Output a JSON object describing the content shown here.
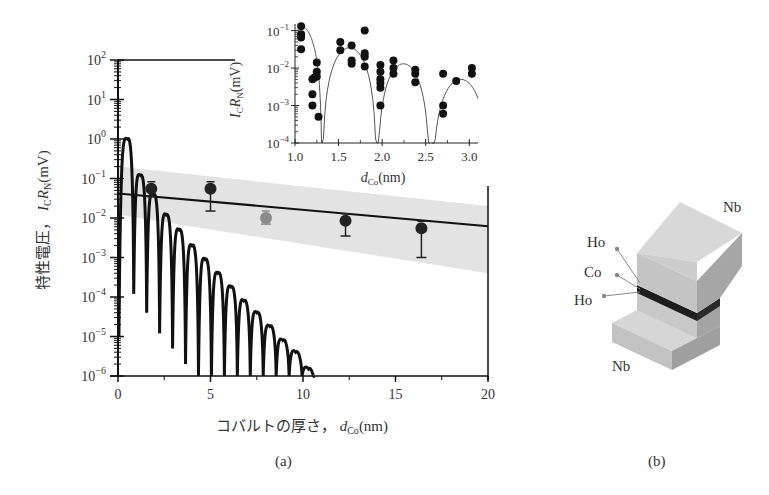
{
  "figure": {
    "panel_a_caption": "(a)",
    "panel_b_caption": "(b)"
  },
  "chart_data": [
    {
      "id": "main",
      "type": "line",
      "title": "",
      "xlabel": "コバルトの厚さ,  d_Co(nm)",
      "xlabel_parts": {
        "text": "コバルトの厚さ，",
        "var": "d",
        "sub": "Co",
        "unit": "(nm)"
      },
      "ylabel": "特性電圧,  I_C R_N(mV)",
      "ylabel_parts": {
        "text": "特性電圧，",
        "var1": "I",
        "sub1": "C",
        "var2": "R",
        "sub2": "N",
        "unit": "(mV)"
      },
      "yscale": "log",
      "xlim": [
        0,
        20
      ],
      "ylim": [
        1e-06,
        100
      ],
      "xticks": [
        0,
        5,
        10,
        15,
        20
      ],
      "xtick_labels": [
        "0",
        "5",
        "10",
        "15",
        "20"
      ],
      "yticks_exp": [
        2,
        1,
        0,
        -1,
        -2,
        -3,
        -4,
        -5,
        -6
      ],
      "series": [
        {
          "name": "experiment (black)",
          "kind": "scatter-errorbar",
          "color": "#222222",
          "x": [
            1.8,
            5.0,
            12.3,
            16.4
          ],
          "y": [
            0.055,
            0.055,
            0.0085,
            0.0055
          ],
          "yerr_low": [
            0.02,
            0.04,
            0.005,
            0.0045
          ]
        },
        {
          "name": "experiment (grey)",
          "kind": "scatter-errorbar",
          "color": "#8a8a8a",
          "x": [
            8.0
          ],
          "y": [
            0.01
          ],
          "yerr_low": [
            0.003
          ]
        },
        {
          "name": "exponential fit",
          "kind": "line",
          "x": [
            0,
            20
          ],
          "y": [
            0.042,
            0.0062
          ]
        },
        {
          "name": "confidence band",
          "kind": "band",
          "color": "#e3e3e3",
          "x": [
            0,
            20
          ],
          "upper": [
            0.2,
            0.02
          ],
          "lower": [
            0.012,
            0.0004
          ]
        },
        {
          "name": "oscillating theory",
          "kind": "line",
          "peaks_x": [
            0.5,
            1.2,
            1.9,
            2.6,
            3.3,
            4.0,
            4.7,
            5.4,
            6.1,
            6.8,
            7.5,
            8.2,
            8.9,
            9.6,
            10.3
          ],
          "peaks_y": [
            1.0,
            0.12,
            0.04,
            0.012,
            0.005,
            0.002,
            0.0009,
            0.0004,
            0.00018,
            8e-05,
            4e-05,
            1.8e-05,
            8e-06,
            4e-06,
            1.5e-06
          ]
        }
      ]
    },
    {
      "id": "inset",
      "type": "scatter",
      "xlabel": "d_Co(nm)",
      "xlabel_parts": {
        "var": "d",
        "sub": "Co",
        "unit": "(nm)"
      },
      "ylabel": "I_C R_N(mV)",
      "ylabel_parts": {
        "var1": "I",
        "sub1": "C",
        "var2": "R",
        "sub2": "N",
        "unit": "(mV)"
      },
      "yscale": "log",
      "xlim": [
        1.0,
        3.1
      ],
      "ylim": [
        0.0001,
        0.15
      ],
      "xticks": [
        1.0,
        1.5,
        2.0,
        2.5,
        3.0
      ],
      "xtick_labels": [
        "1.0",
        "1.5",
        "2.0",
        "2.5",
        "3.0"
      ],
      "yticks_exp": [
        -1,
        -2,
        -3,
        -4
      ],
      "points": {
        "x": [
          1.07,
          1.07,
          1.07,
          1.07,
          1.2,
          1.2,
          1.2,
          1.22,
          1.25,
          1.25,
          1.25,
          1.27,
          1.52,
          1.52,
          1.65,
          1.65,
          1.65,
          1.8,
          1.8,
          1.8,
          1.8,
          1.98,
          1.98,
          1.98,
          1.98,
          1.98,
          1.98,
          2.13,
          2.13,
          2.13,
          2.38,
          2.38,
          2.38,
          2.7,
          2.7,
          2.7,
          2.85,
          3.03,
          3.03
        ],
        "y": [
          0.13,
          0.08,
          0.065,
          0.032,
          0.005,
          0.002,
          0.001,
          0.0055,
          0.014,
          0.008,
          0.006,
          0.0005,
          0.05,
          0.03,
          0.04,
          0.016,
          0.013,
          0.1,
          0.025,
          0.02,
          0.011,
          0.012,
          0.008,
          0.005,
          0.004,
          0.003,
          0.001,
          0.016,
          0.01,
          0.007,
          0.009,
          0.007,
          0.0042,
          0.007,
          0.001,
          0.0006,
          0.0045,
          0.01,
          0.007
        ]
      },
      "curve_lobes": [
        {
          "x_range": [
            1.07,
            1.31
          ],
          "peak": 0.13
        },
        {
          "x_range": [
            1.31,
            1.94
          ],
          "peak": 0.035
        },
        {
          "x_range": [
            1.94,
            2.55
          ],
          "peak": 0.013
        },
        {
          "x_range": [
            2.57,
            3.1
          ],
          "peak": 0.005
        }
      ]
    }
  ],
  "diagram": {
    "labels": {
      "nb_top": "Nb",
      "nb_bottom": "Nb",
      "ho_top": "Ho",
      "co": "Co",
      "ho_bottom": "Ho"
    },
    "colors": {
      "block_top": "#d4d4d4",
      "block_front": "#bdbdbd",
      "block_side": "#a8a8a8",
      "layer": "#1e1e1e"
    }
  }
}
